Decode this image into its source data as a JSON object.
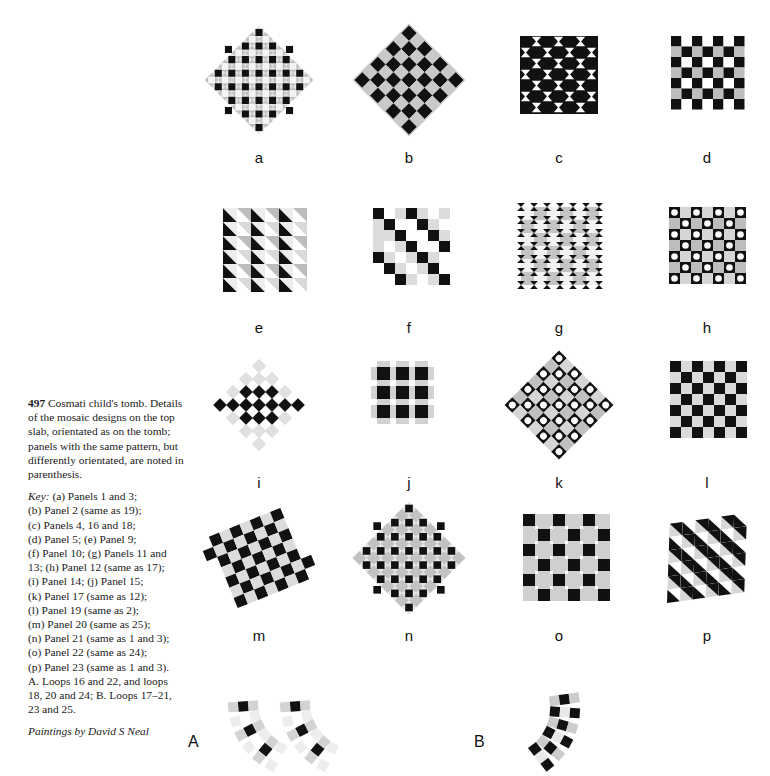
{
  "figure": {
    "number": "497",
    "title": "Cosmati child's tomb.",
    "description": "Details of the mosaic designs on the top slab, orientated as on the tomb; panels with the same pattern, but differently orientated, are noted in parenthesis.",
    "key_word": "Key:",
    "key_lines": [
      "(a) Panels 1 and 3;",
      "(b) Panel 2 (same as 19);",
      "(c) Panels 4, 16 and 18;",
      "(d) Panel 5; (e) Panel 9;",
      "(f) Panel 10; (g) Panels 11 and",
      "13; (h) Panel 12 (same as 17);",
      "(i) Panel 14; (j) Panel 15;",
      "(k) Panel 17 (same as 12);",
      "(l) Panel 19 (same as 2);",
      "(m) Panel 20 (same as 25);",
      "(n) Panel 21 (same as 1 and 3);",
      "(o) Panel 22 (same as 24);",
      "(p) Panel 23 (same as 1 and 3).",
      "A. Loops 16 and 22, and loops",
      "18, 20 and 24; B. Loops 17–21,",
      "23 and 25."
    ],
    "credit": "Paintings by David S Neal"
  },
  "colors": {
    "black": "#111111",
    "gray": "#b9b9b9",
    "light_gray": "#d8d8d8",
    "white": "#ffffff",
    "paper": "#ffffff",
    "text": "#1a1a1a"
  },
  "panels": [
    {
      "id": "a",
      "label": "a",
      "pattern": "diamond-lattice-black-on-gray",
      "row": 1,
      "col": 1
    },
    {
      "id": "b",
      "label": "b",
      "pattern": "rotated-checkerboard",
      "row": 1,
      "col": 2
    },
    {
      "id": "c",
      "label": "c",
      "pattern": "square-grid-bowtie-circles",
      "row": 1,
      "col": 3
    },
    {
      "id": "d",
      "label": "d",
      "pattern": "checkerboard-gray-white",
      "row": 1,
      "col": 4
    },
    {
      "id": "e",
      "label": "e",
      "pattern": "half-square-triangles",
      "row": 2,
      "col": 1
    },
    {
      "id": "f",
      "label": "f",
      "pattern": "diagonal-bands",
      "row": 2,
      "col": 2
    },
    {
      "id": "g",
      "label": "g",
      "pattern": "octagons-and-bowties",
      "row": 2,
      "col": 3
    },
    {
      "id": "h",
      "label": "h",
      "pattern": "black-squares-white-circles",
      "row": 2,
      "col": 4
    },
    {
      "id": "i",
      "label": "i",
      "pattern": "sparse-diamond-cross",
      "row": 3,
      "col": 1
    },
    {
      "id": "j",
      "label": "j",
      "pattern": "three-by-three-grid",
      "row": 3,
      "col": 2
    },
    {
      "id": "k",
      "label": "k",
      "pattern": "rotated-circles-in-squares",
      "row": 3,
      "col": 3
    },
    {
      "id": "l",
      "label": "l",
      "pattern": "plain-checkerboard",
      "row": 3,
      "col": 4
    },
    {
      "id": "m",
      "label": "m",
      "pattern": "tilted-checkerboard",
      "row": 4,
      "col": 1
    },
    {
      "id": "n",
      "label": "n",
      "pattern": "diamond-lattice-dense",
      "row": 4,
      "col": 2
    },
    {
      "id": "o",
      "label": "o",
      "pattern": "checkerboard-open-grid",
      "row": 4,
      "col": 3
    },
    {
      "id": "p",
      "label": "p",
      "pattern": "skewed-triangles",
      "row": 4,
      "col": 4
    }
  ],
  "loops": [
    {
      "id": "A",
      "label": "A",
      "strips": 2
    },
    {
      "id": "B",
      "label": "B",
      "strips": 1
    }
  ]
}
